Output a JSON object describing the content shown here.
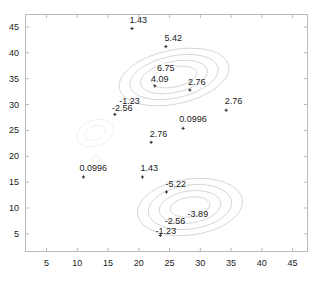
{
  "chart_data": {
    "type": "contour",
    "title": "",
    "xlabel": "",
    "ylabel": "",
    "xlim": [
      1.5,
      47.5
    ],
    "ylim": [
      1.5,
      47.5
    ],
    "grid": false,
    "legend": null,
    "xticks": [
      5,
      10,
      15,
      20,
      25,
      30,
      35,
      40,
      45
    ],
    "yticks": [
      5,
      10,
      15,
      20,
      25,
      30,
      35,
      40,
      45
    ],
    "xtick_labels": [
      "5",
      "10",
      "15",
      "20",
      "25",
      "30",
      "35",
      "40",
      "45"
    ],
    "ytick_labels": [
      "5",
      "10",
      "15",
      "20",
      "25",
      "30",
      "35",
      "40",
      "45"
    ],
    "contour_levels": [
      6.75,
      5.42,
      4.09,
      2.76,
      1.43,
      0.0996,
      -1.23,
      -2.56,
      -3.89,
      -5.22
    ],
    "level_step": 1.33,
    "labels": [
      {
        "text": "1.43",
        "x": 18.9,
        "y": 44.7,
        "lx": 19.9,
        "ly": 46.4,
        "marker": true,
        "inline": false
      },
      {
        "text": "5.42",
        "x": 24.4,
        "y": 41.2,
        "lx": 25.6,
        "ly": 42.9,
        "marker": true,
        "inline": false
      },
      {
        "text": "6.75",
        "x": 24.4,
        "y": 37.0,
        "lx": 24.4,
        "ly": 37.0,
        "marker": false,
        "inline": true
      },
      {
        "text": "4.09",
        "x": 22.6,
        "y": 33.6,
        "lx": 23.4,
        "ly": 34.9,
        "marker": true,
        "inline": false
      },
      {
        "text": "2.76",
        "x": 28.3,
        "y": 32.8,
        "lx": 29.4,
        "ly": 34.4,
        "marker": true,
        "inline": false
      },
      {
        "text": "2.76",
        "x": 34.2,
        "y": 28.9,
        "lx": 35.4,
        "ly": 30.6,
        "marker": true,
        "inline": false
      },
      {
        "text": "-1.23",
        "x": 16.1,
        "y": 28.1,
        "lx": 18.5,
        "ly": 30.6,
        "marker": false,
        "inline": false
      },
      {
        "text": "-2.56",
        "x": 16.1,
        "y": 28.1,
        "lx": 17.3,
        "ly": 29.4,
        "marker": true,
        "inline": false
      },
      {
        "text": "0.0996",
        "x": 27.2,
        "y": 25.4,
        "lx": 28.8,
        "ly": 27.2,
        "marker": true,
        "inline": false
      },
      {
        "text": "2.76",
        "x": 22.0,
        "y": 22.7,
        "lx": 23.2,
        "ly": 24.4,
        "marker": true,
        "inline": false
      },
      {
        "text": "0.0996",
        "x": 11.0,
        "y": 16.0,
        "lx": 12.6,
        "ly": 17.8,
        "marker": true,
        "inline": false
      },
      {
        "text": "1.43",
        "x": 20.6,
        "y": 16.0,
        "lx": 21.7,
        "ly": 17.8,
        "marker": true,
        "inline": false
      },
      {
        "text": "-5.22",
        "x": 24.5,
        "y": 13.1,
        "lx": 26.0,
        "ly": 14.6,
        "marker": true,
        "inline": false
      },
      {
        "text": "-3.89",
        "x": 28.6,
        "y": 8.4,
        "lx": 29.6,
        "ly": 8.9,
        "marker": false,
        "inline": false
      },
      {
        "text": "-2.56",
        "x": 25.3,
        "y": 7.3,
        "lx": 25.9,
        "ly": 7.4,
        "marker": false,
        "inline": false
      },
      {
        "text": "-1.23",
        "x": 23.5,
        "y": 4.7,
        "lx": 24.4,
        "ly": 5.6,
        "marker": true,
        "inline": false
      }
    ],
    "peaks": [
      {
        "name": "upper-peak",
        "cx": 24.4,
        "cy": 37.0,
        "value": 6.75
      },
      {
        "name": "lower-trough",
        "cx": 27.0,
        "cy": 11.0,
        "value": -5.22
      },
      {
        "name": "faint-ring",
        "cx": 13.5,
        "cy": 26.0,
        "value": -2.56
      }
    ]
  }
}
